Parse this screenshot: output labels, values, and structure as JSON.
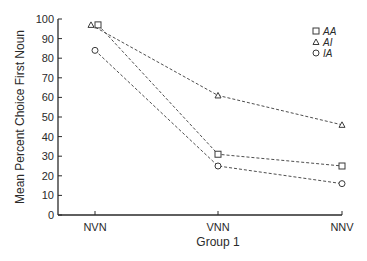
{
  "chart_data": {
    "type": "line",
    "title": "",
    "xlabel": "Group 1",
    "ylabel": "Mean Percent Choice First Noun",
    "categories": [
      "NVN",
      "VNN",
      "NNV"
    ],
    "ylim": [
      0,
      100
    ],
    "yticks": [
      0,
      10,
      20,
      30,
      40,
      50,
      60,
      70,
      80,
      90,
      100
    ],
    "grid": false,
    "legend_position": "upper right",
    "line_style": "dashed",
    "series": [
      {
        "name": "AA",
        "marker": "square",
        "values": [
          97,
          31,
          25
        ]
      },
      {
        "name": "AI",
        "marker": "triangle",
        "values": [
          97,
          61,
          46
        ]
      },
      {
        "name": "IA",
        "marker": "circle",
        "values": [
          84,
          25,
          16
        ]
      }
    ]
  },
  "colors": {
    "axis": "#2a2a2a",
    "line": "#3a3a3a",
    "background": "#ffffff"
  }
}
